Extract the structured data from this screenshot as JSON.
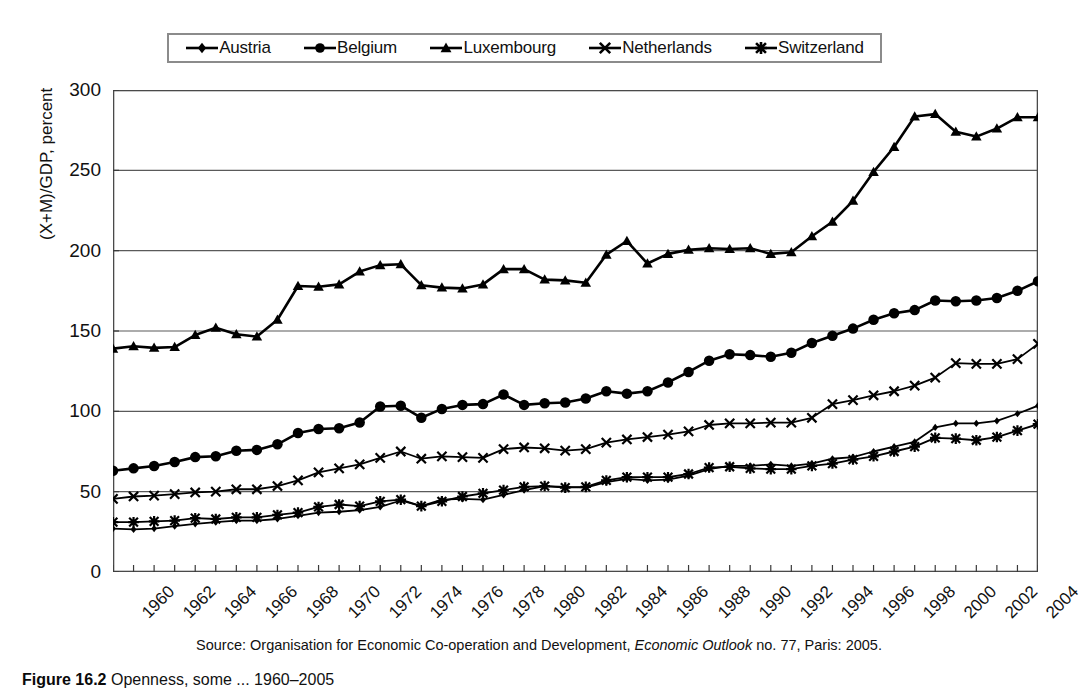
{
  "legend": {
    "position": "top",
    "entries": [
      {
        "label": "Austria",
        "marker": "diamond",
        "color": "#000000"
      },
      {
        "label": "Belgium",
        "marker": "circle",
        "color": "#000000"
      },
      {
        "label": "Luxembourg",
        "marker": "triangle",
        "color": "#000000"
      },
      {
        "label": "Netherlands",
        "marker": "x",
        "color": "#000000"
      },
      {
        "label": "Switzerland",
        "marker": "asterisk",
        "color": "#000000"
      }
    ]
  },
  "source": {
    "prefix": "Source: Organisation for Economic Co-operation and Development, ",
    "italic": "Economic Outlook",
    "suffix": " no. 77, Paris: 2005."
  },
  "caption": {
    "number": "Figure 16.2",
    "text": "Openness, some ... 1960–2005"
  },
  "chart_data": {
    "type": "line",
    "title": "",
    "xlabel": "",
    "ylabel": "(X+M)/GDP, percent",
    "ylim": [
      0,
      300
    ],
    "yticks": [
      0,
      50,
      100,
      150,
      200,
      250,
      300
    ],
    "xlim": [
      1960,
      2005
    ],
    "xticks": [
      1960,
      1962,
      1964,
      1966,
      1968,
      1970,
      1972,
      1974,
      1976,
      1978,
      1980,
      1982,
      1984,
      1986,
      1988,
      1990,
      1992,
      1994,
      1996,
      1998,
      2000,
      2002,
      2004
    ],
    "grid": "horizontal",
    "legend_position": "top",
    "x": [
      1960,
      1961,
      1962,
      1963,
      1964,
      1965,
      1966,
      1967,
      1968,
      1969,
      1970,
      1971,
      1972,
      1973,
      1974,
      1975,
      1976,
      1977,
      1978,
      1979,
      1980,
      1981,
      1982,
      1983,
      1984,
      1985,
      1986,
      1987,
      1988,
      1989,
      1990,
      1991,
      1992,
      1993,
      1994,
      1995,
      1996,
      1997,
      1998,
      1999,
      2000,
      2001,
      2002,
      2003,
      2004,
      2005
    ],
    "series": [
      {
        "name": "Austria",
        "marker": "diamond",
        "values": [
          27,
          26.5,
          27,
          28.5,
          30,
          31,
          32,
          32,
          33,
          35,
          37,
          37.5,
          38.5,
          40.5,
          44.5,
          41,
          45,
          45.5,
          45,
          48,
          51,
          53.5,
          53,
          52.5,
          56,
          58,
          57,
          57.5,
          60,
          64,
          66,
          66,
          67,
          66,
          67.5,
          70.5,
          71.5,
          75,
          78,
          81,
          90,
          92.5,
          92.5,
          94,
          98.5,
          103.5
        ]
      },
      {
        "name": "Belgium",
        "marker": "circle",
        "values": [
          63,
          64.5,
          66,
          68.5,
          71.5,
          72,
          75.5,
          76,
          79.5,
          86.5,
          89,
          89.5,
          93,
          103,
          103.5,
          96,
          101.5,
          104,
          104.5,
          110.5,
          104,
          105,
          105.5,
          108,
          112.5,
          111,
          112.5,
          118,
          124.5,
          131.5,
          135.5,
          135,
          134,
          136.5,
          142.5,
          147,
          151.5,
          157,
          161,
          163,
          169,
          168.5,
          169,
          170.5,
          175,
          181
        ]
      },
      {
        "name": "Luxembourg",
        "marker": "triangle",
        "values": [
          139,
          140.5,
          139.5,
          140,
          147.5,
          152,
          148,
          146.5,
          157,
          178,
          177.5,
          179,
          187,
          191,
          191.5,
          178.5,
          177,
          176.5,
          179,
          188.5,
          188.5,
          182,
          181.5,
          180,
          197.5,
          206,
          192,
          198,
          200.5,
          201.5,
          201,
          201.5,
          198,
          199,
          209,
          218,
          231,
          249,
          264.5,
          283.5,
          285,
          274,
          271,
          276,
          283,
          283
        ]
      },
      {
        "name": "Netherlands",
        "marker": "x",
        "values": [
          45.5,
          47,
          47.5,
          48.5,
          49.5,
          50,
          51.5,
          51.5,
          53.5,
          57,
          62,
          64.5,
          67,
          71,
          75,
          70.5,
          72,
          71.5,
          71,
          76.5,
          77.5,
          77,
          75.5,
          76.5,
          80.5,
          82.5,
          84,
          85.5,
          87.5,
          91.5,
          92.5,
          92.5,
          93,
          93,
          96,
          104.5,
          107,
          110,
          112.5,
          116,
          121,
          130,
          129.5,
          129.5,
          132.5,
          142
        ]
      },
      {
        "name": "Switzerland",
        "marker": "asterisk",
        "values": [
          31,
          31,
          31.5,
          32,
          33.5,
          33,
          34,
          34,
          35.5,
          37,
          40.5,
          42,
          41,
          44,
          45,
          41,
          44,
          47,
          49,
          51,
          53,
          53.5,
          52.5,
          53,
          57,
          59,
          59,
          59,
          61,
          65,
          65.5,
          64.5,
          64,
          64,
          66,
          67.5,
          70,
          72,
          75,
          78,
          83.5,
          83,
          82,
          84,
          88,
          92
        ]
      }
    ]
  }
}
